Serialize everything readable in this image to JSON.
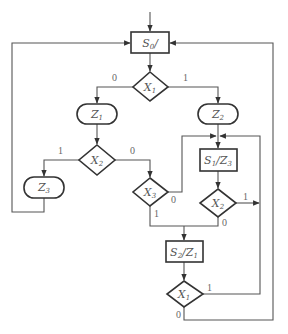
{
  "diagram": {
    "type": "ASM chart",
    "nodes": {
      "s0": {
        "kind": "state",
        "main": "S",
        "sub": "0",
        "suffix": "/"
      },
      "x1_top": {
        "kind": "decision",
        "main": "X",
        "sub": "1"
      },
      "z1": {
        "kind": "conditional-output",
        "main": "Z",
        "sub": "1"
      },
      "z2": {
        "kind": "conditional-output",
        "main": "Z",
        "sub": "2"
      },
      "x2_left": {
        "kind": "decision",
        "main": "X",
        "sub": "2"
      },
      "z3": {
        "kind": "conditional-output",
        "main": "Z",
        "sub": "3"
      },
      "x3": {
        "kind": "decision",
        "main": "X",
        "sub": "3"
      },
      "s1": {
        "kind": "state",
        "main": "S",
        "sub": "1",
        "mid": "/Z",
        "sub2": "3"
      },
      "x2_right": {
        "kind": "decision",
        "main": "X",
        "sub": "2"
      },
      "s2": {
        "kind": "state",
        "main": "S",
        "sub": "2",
        "mid": "/Z",
        "sub2": "1"
      },
      "x1_bottom": {
        "kind": "decision",
        "main": "X",
        "sub": "1"
      }
    },
    "branch_labels": {
      "x1_top_0": "0",
      "x1_top_1": "1",
      "x2_left_1": "1",
      "x2_left_0": "0",
      "x3_0": "0",
      "x3_1": "1",
      "x2_right_1": "1",
      "x2_right_0": "0",
      "x1_bottom_1": "1",
      "x1_bottom_0": "0"
    },
    "edges": [
      {
        "from": "entry",
        "to": "s0"
      },
      {
        "from": "s0",
        "to": "x1_top"
      },
      {
        "from": "x1_top",
        "to": "z1",
        "label": "0"
      },
      {
        "from": "x1_top",
        "to": "z2",
        "label": "1"
      },
      {
        "from": "z1",
        "to": "x2_left"
      },
      {
        "from": "x2_left",
        "to": "z3",
        "label": "1"
      },
      {
        "from": "x2_left",
        "to": "x3",
        "label": "0"
      },
      {
        "from": "z3",
        "to": "s0"
      },
      {
        "from": "z2",
        "to": "s1"
      },
      {
        "from": "x3",
        "to": "s1",
        "label": "0"
      },
      {
        "from": "x3",
        "to": "s2",
        "label": "1"
      },
      {
        "from": "s1",
        "to": "x2_right"
      },
      {
        "from": "x2_right",
        "to": "exit-right",
        "label": "1"
      },
      {
        "from": "x2_right",
        "to": "s2",
        "label": "0"
      },
      {
        "from": "s2",
        "to": "x1_bottom"
      },
      {
        "from": "x1_bottom",
        "to": "s1",
        "label": "1"
      },
      {
        "from": "x1_bottom",
        "to": "s0",
        "label": "0"
      }
    ]
  }
}
